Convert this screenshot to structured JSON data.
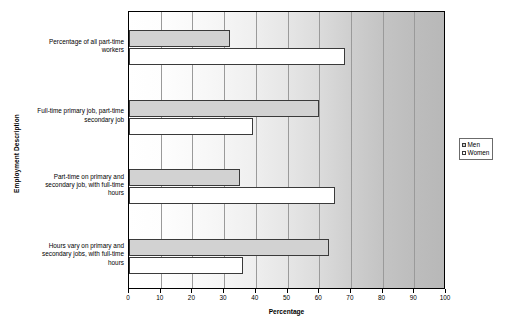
{
  "chart_data": {
    "type": "bar",
    "orientation": "horizontal",
    "title": "",
    "xlabel": "Percentage",
    "ylabel": "Employment Description",
    "xlim": [
      0,
      100
    ],
    "xticks": [
      0,
      10,
      20,
      30,
      40,
      50,
      60,
      70,
      80,
      90,
      100
    ],
    "grid": true,
    "legend_position": "right",
    "categories": [
      "Percentage of all part-time workers",
      "Full-time primary job, part-time secondary job",
      "Part-time on primary and secondary job, with full-time hours",
      "Hours vary on primary and secondary jobs, with full-time hours"
    ],
    "series": [
      {
        "name": "Men",
        "color": "#d2d2d2",
        "values": [
          32,
          60,
          35,
          63
        ]
      },
      {
        "name": "Women",
        "color": "#ffffff",
        "values": [
          68,
          39,
          65,
          36
        ]
      }
    ]
  },
  "axes": {
    "y_title": "Employment Description",
    "x_title": "Percentage",
    "category_lines": [
      [
        "Percentage of all part-time",
        "workers"
      ],
      [
        "Full-time primary job, part-time",
        "secondary job"
      ],
      [
        "Part-time on primary and",
        "secondary job, with full-time",
        "hours"
      ],
      [
        "Hours vary on primary and",
        "secondary jobs, with full-time",
        "hours"
      ]
    ],
    "tick_labels": [
      "0",
      "10",
      "20",
      "30",
      "40",
      "50",
      "60",
      "70",
      "80",
      "90",
      "100"
    ]
  },
  "legend": {
    "items": [
      {
        "label": "Men",
        "swatch": "men"
      },
      {
        "label": "Women",
        "swatch": "women"
      }
    ]
  }
}
